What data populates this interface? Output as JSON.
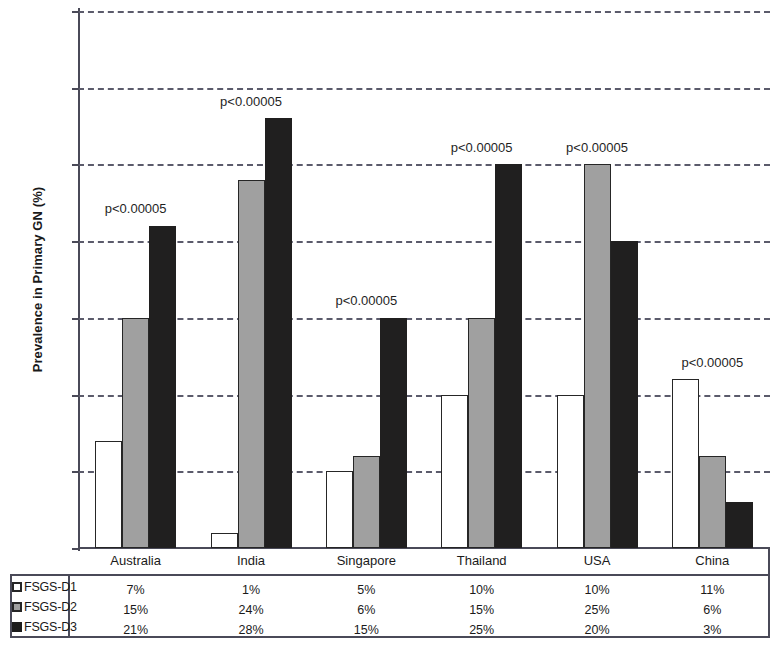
{
  "chart_data": {
    "type": "bar",
    "title": "",
    "xlabel": "",
    "ylabel": "Prevalence in Primary GN (%)",
    "ylim": [
      0,
      0.35
    ],
    "grid": true,
    "legend_position": "bottom-left",
    "yticks": [
      "0",
      "0.05",
      "0.1",
      "0.15",
      "0.2",
      "0.25",
      "0.3",
      "0.35"
    ],
    "ytick_values": [
      0,
      0.05,
      0.1,
      0.15,
      0.2,
      0.25,
      0.3,
      0.35
    ],
    "categories": [
      "Australia",
      "India",
      "Singapore",
      "Thailand",
      "USA",
      "China"
    ],
    "series": [
      {
        "name": "FSGS-D1",
        "color": "#ffffff",
        "values": [
          0.07,
          0.01,
          0.05,
          0.1,
          0.1,
          0.11
        ]
      },
      {
        "name": "FSGS-D2",
        "color": "#a0a0a0",
        "values": [
          0.15,
          0.24,
          0.06,
          0.15,
          0.25,
          0.06
        ]
      },
      {
        "name": "FSGS-D3",
        "color": "#201f1f",
        "values": [
          0.21,
          0.28,
          0.15,
          0.25,
          0.2,
          0.03
        ]
      }
    ],
    "annotations": [
      {
        "text": "p<0.00005",
        "category": "Australia",
        "y": 0.226
      },
      {
        "text": "p<0.00005",
        "category": "India",
        "y": 0.296
      },
      {
        "text": "p<0.00005",
        "category": "Singapore",
        "y": 0.166
      },
      {
        "text": "p<0.00005",
        "category": "Thailand",
        "y": 0.266
      },
      {
        "text": "p<0.00005",
        "category": "USA",
        "y": 0.266
      },
      {
        "text": "p<0.00005",
        "category": "China",
        "y": 0.126
      }
    ]
  },
  "table": {
    "row_labels": [
      "FSGS-D1",
      "FSGS-D2",
      "FSGS-D3"
    ],
    "columns": [
      "Australia",
      "India",
      "Singapore",
      "Thailand",
      "USA",
      "China"
    ],
    "rows": [
      [
        "7%",
        "1%",
        "5%",
        "10%",
        "10%",
        "11%"
      ],
      [
        "15%",
        "24%",
        "6%",
        "15%",
        "25%",
        "6%"
      ],
      [
        "21%",
        "28%",
        "15%",
        "25%",
        "20%",
        "3%"
      ]
    ]
  }
}
